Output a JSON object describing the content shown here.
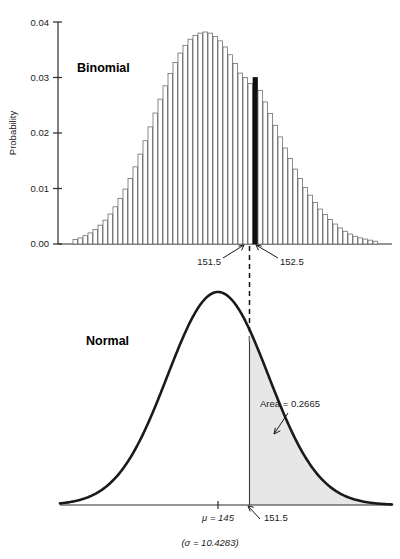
{
  "figure": {
    "panels": [
      {
        "key": "binomial",
        "label": "Binomial",
        "ylabel": "Probability",
        "ytick_labels": [
          "0.00",
          "0.01",
          "0.02",
          "0.03",
          "0.04"
        ],
        "annotations": [
          {
            "name": "lower-bound-label",
            "text": "151.5"
          },
          {
            "name": "upper-bound-label",
            "text": "152.5"
          }
        ]
      },
      {
        "key": "normal",
        "label": "Normal",
        "annotations": [
          {
            "name": "area-label",
            "text": "Area = 0.2665"
          },
          {
            "name": "mean-label",
            "text": "μ = 145"
          },
          {
            "name": "cutoff-label",
            "text": "151.5"
          },
          {
            "name": "sigma-caption",
            "text": "(σ = 10.4283)"
          }
        ]
      }
    ],
    "colors": {
      "bar_fill": "#ffffff",
      "bar_stroke": "#5a5a5a",
      "highlight_bar": "#111111",
      "curve": "#1a1a1a",
      "shaded_area": "#e7e7e7",
      "axis": "#2b2b2b",
      "connector": "#111111"
    }
  },
  "chart_data": [
    {
      "type": "bar",
      "title": "Binomial",
      "xlabel": "",
      "ylabel": "Probability",
      "ylim": [
        0,
        0.04
      ],
      "yticks": [
        0.0,
        0.01,
        0.02,
        0.03,
        0.04
      ],
      "grid": false,
      "legend": "none",
      "xlim": [
        116,
        176
      ],
      "highlight_category": 152,
      "highlight_color": "#111111",
      "annotations": [
        {
          "text": "151.5",
          "points_to_x": 151.5
        },
        {
          "text": "152.5",
          "points_to_x": 152.5
        },
        {
          "text": "Binomial",
          "type": "panel-label"
        }
      ],
      "categories": [
        116,
        117,
        118,
        119,
        120,
        121,
        122,
        123,
        124,
        125,
        126,
        127,
        128,
        129,
        130,
        131,
        132,
        133,
        134,
        135,
        136,
        137,
        138,
        139,
        140,
        141,
        142,
        143,
        144,
        145,
        146,
        147,
        148,
        149,
        150,
        151,
        152,
        153,
        154,
        155,
        156,
        157,
        158,
        159,
        160,
        161,
        162,
        163,
        164,
        165,
        166,
        167,
        168,
        169,
        170,
        171,
        172,
        173,
        174,
        175,
        176
      ],
      "values": [
        0.0008,
        0.0011,
        0.0015,
        0.002,
        0.0026,
        0.0034,
        0.0043,
        0.0054,
        0.0067,
        0.0082,
        0.0099,
        0.0118,
        0.0139,
        0.0162,
        0.0186,
        0.0211,
        0.0236,
        0.0261,
        0.0285,
        0.0307,
        0.0327,
        0.0344,
        0.0358,
        0.0369,
        0.0376,
        0.038,
        0.0382,
        0.038,
        0.0374,
        0.0366,
        0.0355,
        0.0341,
        0.0325,
        0.0308,
        0.03,
        0.0289,
        0.03,
        0.0277,
        0.0256,
        0.0235,
        0.0214,
        0.0193,
        0.0173,
        0.0154,
        0.0135,
        0.0118,
        0.0102,
        0.0088,
        0.0075,
        0.0063,
        0.0053,
        0.0044,
        0.0036,
        0.0029,
        0.0023,
        0.0018,
        0.0014,
        0.0011,
        0.0009,
        0.0007,
        0.0005
      ]
    },
    {
      "type": "line",
      "title": "Normal",
      "xlabel": "",
      "ylabel": "",
      "grid": false,
      "legend": "none",
      "distribution": {
        "mean": 145,
        "sd": 10.4283
      },
      "shaded_region": {
        "from": 151.5,
        "to": "infinity",
        "area": 0.2665,
        "color": "#e7e7e7"
      },
      "xticks": [
        145,
        151.5
      ],
      "xtick_labels": [
        "μ = 145",
        "151.5"
      ],
      "annotations": [
        {
          "text": "Area = 0.2665",
          "type": "callout"
        },
        {
          "text": "(σ = 10.4283)",
          "type": "caption"
        },
        {
          "text": "Normal",
          "type": "panel-label"
        }
      ]
    }
  ]
}
